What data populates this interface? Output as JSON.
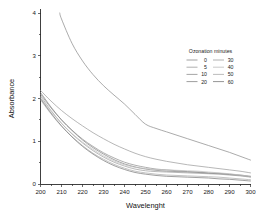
{
  "chart_data": {
    "type": "line",
    "title": "",
    "xlabel": "Wavelenght",
    "ylabel": "Absorbance",
    "xlim": [
      200,
      300
    ],
    "ylim": [
      0,
      4
    ],
    "xticks": [
      200,
      210,
      220,
      230,
      240,
      250,
      260,
      270,
      280,
      290,
      300
    ],
    "yticks": [
      0,
      1,
      2,
      3,
      4
    ],
    "xtick_labels": [
      "200",
      "210",
      "220",
      "230",
      "240",
      "250",
      "260",
      "270",
      "280",
      "290",
      "300"
    ],
    "ytick_labels": [
      "0",
      "1",
      "2",
      "3",
      "4"
    ],
    "grid": false,
    "legend_position": "upper-right",
    "legend_title": "Ozonation minutes",
    "x": [
      200,
      205,
      210,
      215,
      220,
      225,
      230,
      235,
      240,
      245,
      250,
      255,
      260,
      265,
      270,
      275,
      280,
      285,
      290,
      295,
      300
    ],
    "series": [
      {
        "name": "0",
        "color": "#8a8a8a",
        "values": [
          5.95,
          4.72,
          3.86,
          3.29,
          2.88,
          2.56,
          2.3,
          2.08,
          1.87,
          1.63,
          1.4,
          1.3,
          1.22,
          1.14,
          1.06,
          0.98,
          0.9,
          0.82,
          0.74,
          0.65,
          0.56
        ]
      },
      {
        "name": "5",
        "color": "#9a9a9a",
        "values": [
          2.19,
          1.94,
          1.72,
          1.53,
          1.36,
          1.2,
          1.06,
          0.93,
          0.82,
          0.72,
          0.64,
          0.58,
          0.53,
          0.49,
          0.45,
          0.42,
          0.39,
          0.36,
          0.33,
          0.3,
          0.26
        ]
      },
      {
        "name": "10",
        "color": "#8f8f8f",
        "values": [
          2.1,
          1.78,
          1.5,
          1.26,
          1.05,
          0.88,
          0.73,
          0.61,
          0.51,
          0.44,
          0.39,
          0.35,
          0.33,
          0.31,
          0.29,
          0.28,
          0.26,
          0.25,
          0.23,
          0.21,
          0.18
        ]
      },
      {
        "name": "20",
        "color": "#848484",
        "values": [
          2.14,
          1.8,
          1.5,
          1.25,
          1.03,
          0.85,
          0.7,
          0.57,
          0.47,
          0.4,
          0.35,
          0.32,
          0.3,
          0.29,
          0.28,
          0.27,
          0.25,
          0.24,
          0.22,
          0.2,
          0.17
        ]
      },
      {
        "name": "30",
        "color": "#9e9e9e",
        "values": [
          2.06,
          1.72,
          1.42,
          1.17,
          0.96,
          0.78,
          0.63,
          0.51,
          0.42,
          0.35,
          0.31,
          0.29,
          0.28,
          0.27,
          0.26,
          0.25,
          0.24,
          0.23,
          0.21,
          0.19,
          0.16
        ]
      },
      {
        "name": "40",
        "color": "#bdbdbd",
        "values": [
          2.02,
          1.7,
          1.42,
          1.18,
          0.98,
          0.81,
          0.66,
          0.54,
          0.45,
          0.39,
          0.36,
          0.34,
          0.33,
          0.32,
          0.31,
          0.3,
          0.28,
          0.26,
          0.24,
          0.21,
          0.18
        ]
      },
      {
        "name": "50",
        "color": "#ababab",
        "values": [
          1.97,
          1.64,
          1.35,
          1.11,
          0.9,
          0.72,
          0.58,
          0.46,
          0.37,
          0.3,
          0.26,
          0.23,
          0.21,
          0.2,
          0.19,
          0.18,
          0.17,
          0.16,
          0.14,
          0.12,
          0.1
        ]
      },
      {
        "name": "60",
        "color": "#7a7a7a",
        "values": [
          2.0,
          1.66,
          1.36,
          1.1,
          0.88,
          0.7,
          0.55,
          0.43,
          0.34,
          0.27,
          0.23,
          0.2,
          0.18,
          0.17,
          0.16,
          0.15,
          0.14,
          0.12,
          0.11,
          0.09,
          0.07
        ]
      }
    ],
    "legend_entries_left": [
      "0",
      "5",
      "10",
      "20"
    ],
    "legend_entries_right": [
      "30",
      "40",
      "50",
      "60"
    ]
  }
}
